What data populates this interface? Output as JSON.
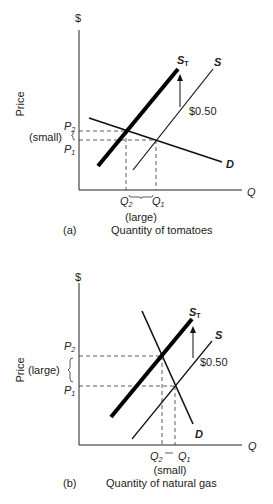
{
  "panels": [
    {
      "id": "a",
      "panel_label": "(a)",
      "x_axis_title": "Quantity of tomatoes",
      "y_axis_title": "Price",
      "y_axis_symbol": "$",
      "x_axis_symbol": "Q",
      "supply_label": "S",
      "taxed_supply_label": "S",
      "taxed_supply_subscript": "T",
      "demand_label": "D",
      "tax_label": "$0.50",
      "p2_label": "P",
      "p2_sub": "2",
      "p1_label": "P",
      "p1_sub": "1",
      "q2_label": "Q",
      "q2_sub": "2",
      "q1_label": "Q",
      "q1_sub": "1",
      "price_change_note": "(small)",
      "quantity_change_note": "(large)"
    },
    {
      "id": "b",
      "panel_label": "(b)",
      "x_axis_title": "Quantity of natural gas",
      "y_axis_title": "Price",
      "y_axis_symbol": "$",
      "x_axis_symbol": "Q",
      "supply_label": "S",
      "taxed_supply_label": "S",
      "taxed_supply_subscript": "T",
      "demand_label": "D",
      "tax_label": "$0.50",
      "p2_label": "P",
      "p2_sub": "2",
      "p1_label": "P",
      "p1_sub": "1",
      "q2_label": "Q",
      "q2_sub": "2",
      "q1_label": "Q",
      "q1_sub": "1",
      "price_change_note": "(large)",
      "quantity_change_note": "(small)"
    }
  ]
}
